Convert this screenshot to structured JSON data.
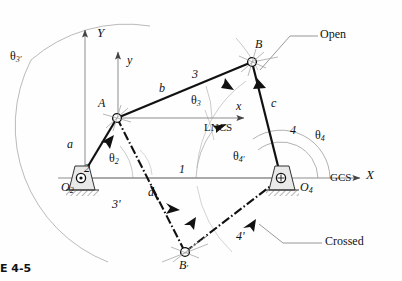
{
  "figure": {
    "caption": "E 4-5",
    "title_note": "Fourbar linkage open and crossed configurations"
  },
  "coordinate_systems": {
    "global": {
      "name": "GCS",
      "x_axis_label": "X",
      "y_axis_label": "Y"
    },
    "local": {
      "name": "LNCS",
      "x_axis_label": "x",
      "y_axis_label": "y"
    }
  },
  "joints": [
    {
      "id": "O2",
      "label": "O",
      "sub": "2",
      "x": 81,
      "y": 178,
      "type": "ground-pivot"
    },
    {
      "id": "A",
      "label": "A",
      "sub": "",
      "x": 117,
      "y": 118,
      "type": "pin-joint"
    },
    {
      "id": "B",
      "label": "B",
      "sub": "",
      "x": 252,
      "y": 62,
      "type": "pin-joint"
    },
    {
      "id": "O4",
      "label": "O",
      "sub": "4",
      "x": 281,
      "y": 178,
      "type": "ground-pivot"
    },
    {
      "id": "Bp",
      "label": "B",
      "sub": "'",
      "x": 185,
      "y": 252,
      "type": "pin-joint"
    }
  ],
  "links": [
    {
      "number": "2",
      "letter": "a",
      "from": "O2",
      "to": "A",
      "style": "open"
    },
    {
      "number": "3",
      "letter": "b",
      "from": "A",
      "to": "B",
      "style": "open"
    },
    {
      "number": "4",
      "letter": "c",
      "from": "B",
      "to": "O4",
      "style": "open"
    },
    {
      "number": "1",
      "letter": "d",
      "from": "O2",
      "to": "O4",
      "style": "ground"
    },
    {
      "number": "3'",
      "letter": "",
      "from": "A",
      "to": "Bp",
      "style": "crossed"
    },
    {
      "number": "4'",
      "letter": "",
      "from": "Bp",
      "to": "O4",
      "style": "crossed"
    }
  ],
  "angles": [
    {
      "id": "theta2",
      "label": "θ",
      "sub": "2",
      "at": "O2"
    },
    {
      "id": "theta3",
      "label": "θ",
      "sub": "3",
      "at": "A"
    },
    {
      "id": "theta3p",
      "label": "θ",
      "sub": "3'",
      "at": "A"
    },
    {
      "id": "theta4",
      "label": "θ",
      "sub": "4",
      "at": "O4"
    },
    {
      "id": "theta4p",
      "label": "θ",
      "sub": "4'",
      "at": "O4"
    }
  ],
  "callouts": [
    {
      "id": "open",
      "text": "Open",
      "points_to": "B"
    },
    {
      "id": "crossed",
      "text": "Crossed",
      "points_to": "link-4-prime"
    }
  ],
  "colors": {
    "link_line": "#111111",
    "construction_line": "#9a9a9a",
    "ground_hatch": "#4a4a4a",
    "background": "#fefefe"
  }
}
